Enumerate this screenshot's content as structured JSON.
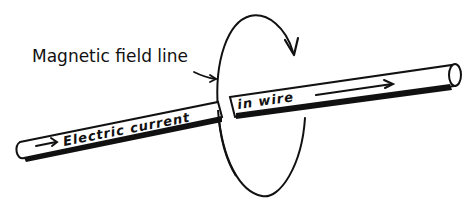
{
  "diagram": {
    "labels": {
      "field_line": "Magnetic field line",
      "current_part1": "Electric current",
      "current_part2": "in wire"
    },
    "colors": {
      "ink": "#111111",
      "background": "#ffffff"
    },
    "icons": {
      "field_pointer": "arrow-right-icon",
      "current_arrow_left": "arrow-right-icon",
      "current_arrow_right": "arrow-right-icon",
      "field_direction": "arrowhead-icon"
    }
  }
}
